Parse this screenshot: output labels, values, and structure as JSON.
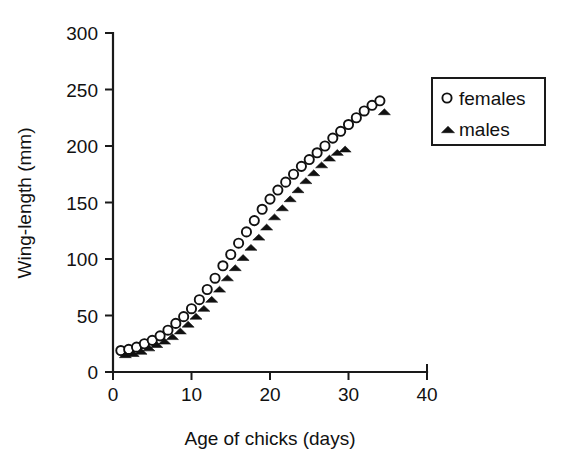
{
  "chart_data": {
    "type": "scatter",
    "title": "",
    "xlabel": "Age of chicks (days)",
    "ylabel": "Wing-length (mm)",
    "xlim": [
      0,
      40
    ],
    "ylim": [
      0,
      300
    ],
    "xticks": [
      0,
      10,
      20,
      30,
      40
    ],
    "yticks": [
      0,
      50,
      100,
      150,
      200,
      250,
      300
    ],
    "xtick_labels": [
      "0",
      "10",
      "20",
      "30",
      "40"
    ],
    "ytick_labels": [
      "0",
      "50",
      "100",
      "150",
      "200",
      "250",
      "300"
    ],
    "grid": false,
    "legend_position": "top-right",
    "series": [
      {
        "name": "females",
        "marker": "open-circle",
        "color": "#111111",
        "x": [
          1,
          2,
          3,
          4,
          5,
          6,
          7,
          8,
          9,
          10,
          11,
          12,
          13,
          14,
          15,
          16,
          17,
          18,
          19,
          20,
          21,
          22,
          23,
          24,
          25,
          26,
          27,
          28,
          29,
          30,
          31,
          32,
          33,
          34
        ],
        "y": [
          19,
          20,
          22,
          25,
          28,
          32,
          37,
          43,
          49,
          56,
          64,
          73,
          83,
          94,
          104,
          114,
          124,
          134,
          144,
          153,
          161,
          168,
          175,
          182,
          188,
          194,
          200,
          207,
          213,
          219,
          225,
          231,
          236,
          240
        ]
      },
      {
        "name": "males",
        "marker": "filled-triangle",
        "color": "#111111",
        "x": [
          1,
          2,
          3,
          4,
          5,
          6,
          7,
          8,
          9,
          10,
          11,
          12,
          13,
          14,
          15,
          16,
          17,
          18,
          19,
          20,
          21,
          22,
          23,
          24,
          25,
          26,
          27,
          28,
          29,
          34
        ],
        "y": [
          18,
          19,
          21,
          24,
          27,
          30,
          34,
          39,
          45,
          52,
          59,
          67,
          76,
          86,
          95,
          104,
          113,
          122,
          131,
          140,
          148,
          156,
          164,
          172,
          179,
          186,
          192,
          197,
          200,
          233
        ]
      }
    ],
    "legend_entries": [
      {
        "label": "females",
        "marker": "open-circle"
      },
      {
        "label": "males",
        "marker": "filled-triangle"
      }
    ]
  }
}
